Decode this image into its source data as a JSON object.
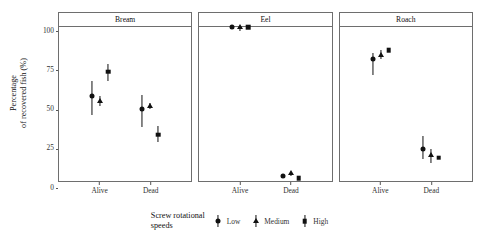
{
  "chart_data": {
    "type": "scatter",
    "title": "",
    "xlabel": "",
    "ylabel": "Percentage\nof recovered fish (%)",
    "ylabel_lines": [
      "Percentage",
      "of recovered fish (%)"
    ],
    "ylim": [
      0,
      100
    ],
    "yticks": [
      0,
      25,
      50,
      75,
      100
    ],
    "ytick_labels": [
      "0",
      "25",
      "50",
      "75",
      "100"
    ],
    "grid": false,
    "legend_position": "bottom",
    "legend_title": "Screw rotational speeds",
    "legend_title_lines": [
      "Screw rotational",
      "speeds"
    ],
    "categories": [
      "Alive",
      "Dead"
    ],
    "facets": [
      "Bream",
      "Eel",
      "Roach"
    ],
    "series": [
      {
        "name": "Low",
        "marker": "circle"
      },
      {
        "name": "Medium",
        "marker": "triangle"
      },
      {
        "name": "High",
        "marker": "square"
      }
    ],
    "points": [
      {
        "facet": "Bream",
        "x": "Alive",
        "series": "Low",
        "y": 55.0,
        "ymin": 43.0,
        "ymax": 65.0
      },
      {
        "facet": "Bream",
        "x": "Alive",
        "series": "Medium",
        "y": 52.0,
        "ymin": 49.0,
        "ymax": 55.0
      },
      {
        "facet": "Bream",
        "x": "Alive",
        "series": "High",
        "y": 71.0,
        "ymin": 65.0,
        "ymax": 76.0
      },
      {
        "facet": "Bream",
        "x": "Dead",
        "series": "Low",
        "y": 47.0,
        "ymin": 35.0,
        "ymax": 56.0
      },
      {
        "facet": "Bream",
        "x": "Dead",
        "series": "Medium",
        "y": 48.5,
        "ymin": 46.5,
        "ymax": 50.5
      },
      {
        "facet": "Bream",
        "x": "Dead",
        "series": "High",
        "y": 30.0,
        "ymin": 25.0,
        "ymax": 36.0
      },
      {
        "facet": "Eel",
        "x": "Alive",
        "series": "Low",
        "y": 100.0,
        "ymin": 100.0,
        "ymax": 100.0
      },
      {
        "facet": "Eel",
        "x": "Alive",
        "series": "Medium",
        "y": 100.0,
        "ymin": 97.5,
        "ymax": 100.0
      },
      {
        "facet": "Eel",
        "x": "Alive",
        "series": "High",
        "y": 100.0,
        "ymin": 100.0,
        "ymax": 100.0
      },
      {
        "facet": "Eel",
        "x": "Dead",
        "series": "Low",
        "y": 3.0,
        "ymin": 3.0,
        "ymax": 3.0
      },
      {
        "facet": "Eel",
        "x": "Dead",
        "series": "Medium",
        "y": 5.5,
        "ymin": 3.0,
        "ymax": 5.5
      },
      {
        "facet": "Eel",
        "x": "Dead",
        "series": "High",
        "y": 2.0,
        "ymin": 2.0,
        "ymax": 2.0
      },
      {
        "facet": "Roach",
        "x": "Alive",
        "series": "Low",
        "y": 79.0,
        "ymin": 69.0,
        "ymax": 83.0
      },
      {
        "facet": "Roach",
        "x": "Alive",
        "series": "Medium",
        "y": 82.0,
        "ymin": 79.0,
        "ymax": 85.0
      },
      {
        "facet": "Roach",
        "x": "Alive",
        "series": "High",
        "y": 85.0,
        "ymin": 84.0,
        "ymax": 86.0
      },
      {
        "facet": "Roach",
        "x": "Dead",
        "series": "Low",
        "y": 21.0,
        "ymin": 14.0,
        "ymax": 29.0
      },
      {
        "facet": "Roach",
        "x": "Dead",
        "series": "Medium",
        "y": 17.0,
        "ymin": 12.0,
        "ymax": 21.0
      },
      {
        "facet": "Roach",
        "x": "Dead",
        "series": "High",
        "y": 15.0,
        "ymin": 15.0,
        "ymax": 15.0
      }
    ]
  },
  "style": {
    "mark_color": "#111111",
    "panel_border_color": "#6e6e6e",
    "background": "#ffffff"
  }
}
